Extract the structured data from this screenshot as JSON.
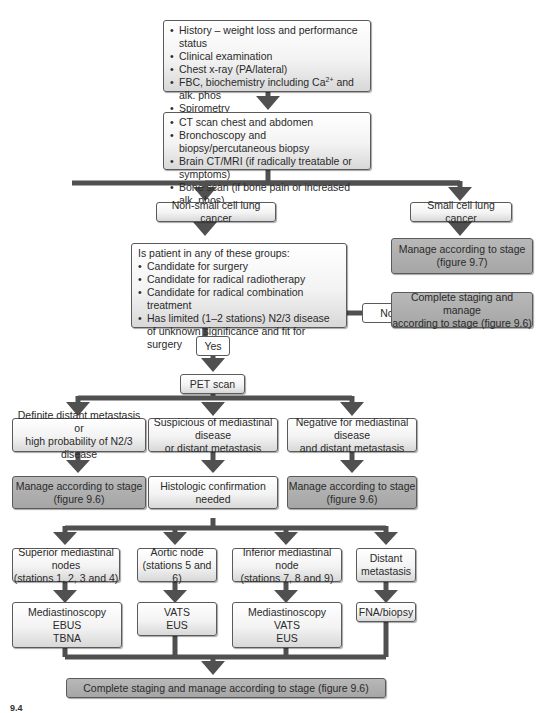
{
  "diagram": {
    "type": "flowchart",
    "colors": {
      "connector": "#505050",
      "light_box": "#f0f0f0",
      "dark_box": "#aaaaaa",
      "border": "#5a5a5a"
    },
    "initial_workup": {
      "items": [
        "History – weight loss and performance status",
        "Clinical examination",
        "Chest x-ray (PA/lateral)",
        "FBC, biochemistry including Ca",
        "Spirometry"
      ],
      "item4_superscript": "2+",
      "item4_suffix": " and alk. phos"
    },
    "further_workup": {
      "items": [
        "CT scan chest and abdomen",
        "Bronchoscopy and biopsy/percutaneous biopsy",
        "Brain CT/MRI (if radically treatable or symptoms)",
        "Bone scan (if bone pain or increased alk. phos)"
      ]
    },
    "nsclc": "Non-small cell lung cancer",
    "sclc": "Small cell lung cancer",
    "sclc_manage": {
      "line1": "Manage according to stage",
      "line2": "(figure 9.7)"
    },
    "question": {
      "title": "Is patient in any of these groups:",
      "items": [
        "Candidate for surgery",
        "Candidate for radical radiotherapy",
        "Candidate for radical combination treatment",
        "Has limited (1–2 stations) N2/3 disease of unknown significance and fit for surgery"
      ]
    },
    "no_label": "No",
    "yes_label": "Yes",
    "no_outcome": {
      "line1": "Complete staging and manage",
      "line2": "according to stage (figure 9.6)"
    },
    "pet": "PET scan",
    "pet_results": [
      {
        "line1": "Definite distant metastasis or",
        "line2": "high probability of N2/3 disease"
      },
      {
        "line1": "Suspicious of mediastinal disease",
        "line2": "or distant metastasis"
      },
      {
        "line1": "Negative for mediastinal disease",
        "line2": "and distant metastasis"
      }
    ],
    "pet_outcomes": [
      {
        "line1": "Manage according to stage",
        "line2": "(figure 9.6)"
      },
      {
        "line1": "Histologic confirmation",
        "line2": "needed"
      },
      {
        "line1": "Manage according to stage",
        "line2": "(figure 9.6)"
      }
    ],
    "sites": [
      {
        "line1": "Superior mediastinal nodes",
        "line2": "(stations 1, 2, 3 and 4)"
      },
      {
        "line1": "Aortic node",
        "line2": "(stations 5 and 6)"
      },
      {
        "line1": "Inferior mediastinal node",
        "line2": "(stations 7, 8 and 9)"
      },
      {
        "line1": "Distant",
        "line2": "metastasis"
      }
    ],
    "procedures": [
      {
        "lines": [
          "Mediastinoscopy",
          "EBUS",
          "TBNA"
        ]
      },
      {
        "lines": [
          "VATS",
          "EUS"
        ]
      },
      {
        "lines": [
          "Mediastinoscopy",
          "VATS",
          "EUS"
        ]
      },
      {
        "lines": [
          "FNA/biopsy"
        ]
      }
    ],
    "final": "Complete staging and manage according to stage (figure 9.6)",
    "figure_label": "9.4"
  }
}
